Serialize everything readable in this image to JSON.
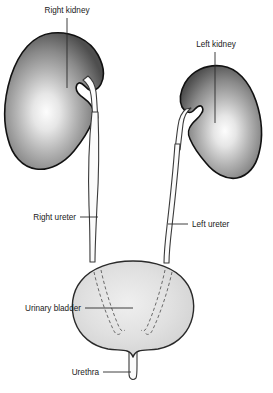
{
  "figure": {
    "background_color": "#ffffff",
    "width": 273,
    "height": 393
  },
  "labels": {
    "right_kidney": "Right kidney",
    "left_kidney": "Left kidney",
    "right_ureter": "Right ureter",
    "left_ureter": "Left ureter",
    "urinary_bladder": "Urinary bladder",
    "urethra": "Urethra"
  },
  "colors": {
    "kidney_edge": "#4a4a4a",
    "kidney_center": "#fdfdfd",
    "kidney_outline": "#111111",
    "bladder_fill": "#d9d9d9",
    "bladder_highlight": "#efefef",
    "bladder_outline": "#2a2a2a",
    "tube_fill": "#fbfbfb",
    "tube_outline": "#3a3a3a",
    "dashed_line": "#6a6a6a",
    "label_text": "#1a1a1a",
    "leader_line": "#2b2b2b"
  },
  "structures": [
    {
      "name": "right-kidney",
      "label": "Right kidney",
      "side": "right",
      "description": "Bean-shaped organ, upper left of figure, hilum facing medially to the right",
      "shaded": true
    },
    {
      "name": "left-kidney",
      "label": "Left kidney",
      "side": "left",
      "description": "Bean-shaped organ, upper right of figure, positioned lower and smaller, hilum facing medially to the left",
      "shaded": true
    },
    {
      "name": "right-ureter",
      "label": "Right ureter",
      "side": "right",
      "description": "Narrow tube descending from right renal pelvis to bladder"
    },
    {
      "name": "left-ureter",
      "label": "Left ureter",
      "side": "left",
      "description": "Narrow tube descending from left renal pelvis to bladder"
    },
    {
      "name": "urinary-bladder",
      "label": "Urinary bladder",
      "description": "Rounded sac at center bottom with dashed intramural ureter segments"
    },
    {
      "name": "urethra",
      "label": "Urethra",
      "description": "Vertical tube exiting the bladder neck with rounded tip"
    }
  ],
  "annotations": {
    "intramural_ureter_dashes": 4,
    "dash_note": "Dashed lines inside bladder indicate ureters passing through the bladder wall"
  }
}
